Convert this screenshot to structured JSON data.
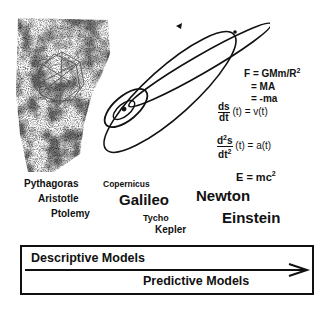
{
  "figure": {
    "equations": {
      "gravity": "F = GMm/R",
      "gravity_exp": "2",
      "ma": "= MA",
      "neg_ma": "= -ma",
      "velocity_num": "ds",
      "velocity_den": "dt",
      "velocity_rhs": "(t)  =  v(t)",
      "accel_num": "d",
      "accel_num_exp": "2",
      "accel_num_tail": "s",
      "accel_den": "dt",
      "accel_den_exp": "2",
      "accel_rhs": "(t) =  a(t)",
      "energy": "E = mc",
      "energy_exp": "2"
    },
    "names": {
      "pythagoras": "Pythagoras",
      "aristotle": "Aristotle",
      "ptolemy": "Ptolemy",
      "copernicus": "Copernicus",
      "galileo": "Galileo",
      "tycho": "Tycho",
      "kepler": "Kepler",
      "newton": "Newton",
      "einstein": "Einstein"
    },
    "spectrum": {
      "descriptive": "Descriptive Models",
      "predictive": "Predictive Models"
    }
  }
}
